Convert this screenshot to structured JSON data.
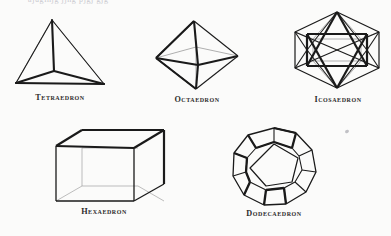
{
  "plate": {
    "background_color": "#fbfbfa",
    "ink_color": "#1a1a1a",
    "hidden_edge_color": "#9a9a9a",
    "top_bleed_text": "ajugihjg  jjhg  pjgj  gjg",
    "subject": "The five regular (Platonic) solids"
  },
  "figures": [
    {
      "id": "tetraedron",
      "caption": "Tetraedron",
      "faces": 4,
      "face_shape": "equilateral triangle",
      "view": "vertex-up, three base vertices, centre vertex visible",
      "caption_x": 17,
      "caption_y": 93
    },
    {
      "id": "octaedron",
      "caption": "Octaedron",
      "faces": 8,
      "face_shape": "equilateral triangle",
      "view": "apex up and down with rhombic equator",
      "caption_x": 166,
      "caption_y": 95
    },
    {
      "id": "icosaedron",
      "caption": "Icosaedron",
      "faces": 20,
      "face_shape": "equilateral triangle",
      "view": "down a three-fold axis, hexagonal outline",
      "caption_x": 303,
      "caption_y": 95
    },
    {
      "id": "hexaedron",
      "caption": "Hexaedron",
      "faces": 6,
      "face_shape": "square",
      "view": "near-isometric cube with hidden edges",
      "caption_x": 62,
      "caption_y": 207
    },
    {
      "id": "dodecaedron",
      "caption": "Dodecaedron",
      "faces": 12,
      "face_shape": "regular pentagon",
      "view": "down a five-fold axis, decagonal outline",
      "caption_x": 229,
      "caption_y": 209
    }
  ]
}
